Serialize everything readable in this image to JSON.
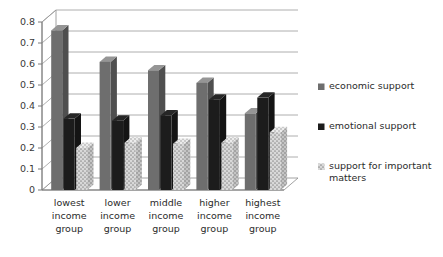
{
  "chart_data": {
    "type": "bar",
    "title": "",
    "subtitle": "",
    "xlabel": "",
    "ylabel": "",
    "ylim": [
      0,
      0.8
    ],
    "ytick_labels": [
      "0.8",
      "0.7",
      "0.6",
      "0.5",
      "0.4",
      "0.3",
      "0.2",
      "0.1",
      "0"
    ],
    "ytick_values": [
      0.8,
      0.7,
      0.6,
      0.5,
      0.4,
      0.3,
      0.2,
      0.1,
      0
    ],
    "grid": true,
    "legend_position": "right",
    "style": "3d-clustered-column",
    "categories": [
      "lowest income group",
      "lower income group",
      "middle income group",
      "higher income group",
      "highest income group"
    ],
    "category_lines": [
      [
        "lowest",
        "income",
        "group"
      ],
      [
        "lower",
        "income",
        "group"
      ],
      [
        "middle",
        "income",
        "group"
      ],
      [
        "higher",
        "income",
        "group"
      ],
      [
        "highest",
        "income",
        "group"
      ]
    ],
    "series": [
      {
        "name": "economic support",
        "color": "#6e6e6e",
        "fill": "solid",
        "values": [
          0.76,
          0.61,
          0.57,
          0.51,
          0.365
        ]
      },
      {
        "name": "emotional support",
        "color": "#1c1c1c",
        "fill": "solid",
        "values": [
          0.34,
          0.33,
          0.355,
          0.43,
          0.44
        ]
      },
      {
        "name": "support for important matters",
        "color": "#d9d9d9",
        "fill": "dotted",
        "values": [
          0.2,
          0.225,
          0.22,
          0.225,
          0.275
        ]
      }
    ]
  },
  "legend": {
    "items": [
      {
        "label": "economic support",
        "swatch": "#6e6e6e",
        "fill": "solid"
      },
      {
        "label": "emotional support",
        "swatch": "#1c1c1c",
        "fill": "solid"
      },
      {
        "label": "support for important matters",
        "swatch": "#d9d9d9",
        "fill": "dotted"
      }
    ],
    "item_lines": [
      [
        "economic support"
      ],
      [
        "emotional support"
      ],
      [
        "support for important",
        "matters"
      ]
    ]
  },
  "colors": {
    "background": "#ffffff",
    "axis": "#808080",
    "gridline": "#9a9a9a",
    "floor": "#ffffff",
    "text": "#2b2b2b"
  }
}
